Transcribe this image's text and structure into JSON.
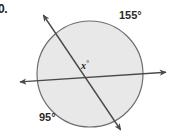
{
  "figure": {
    "problem_number": "0.",
    "variable_label": "x",
    "variable_degree_symbol": "°",
    "circle": {
      "center_x": 90,
      "center_y": 74,
      "radius": 53,
      "fill_color": "#e8e8e8",
      "stroke_color": "#6e6e6e"
    },
    "lines": [
      {
        "name": "near-horizontal-double-arrow-line",
        "x1": 18,
        "y1": 82,
        "x2": 168,
        "y2": 72,
        "arrow_start": true,
        "arrow_end": true,
        "color": "#4a4a4a"
      },
      {
        "name": "diagonal-double-arrow-line",
        "x1": 42,
        "y1": 13,
        "x2": 122,
        "y2": 132,
        "arrow_start": true,
        "arrow_end": true,
        "color": "#4a4a4a"
      }
    ],
    "angles": [
      {
        "name": "angle-top-right",
        "value": "155°",
        "position": "top-right"
      },
      {
        "name": "angle-bottom-left",
        "value": "95°",
        "position": "bottom-left"
      }
    ]
  }
}
